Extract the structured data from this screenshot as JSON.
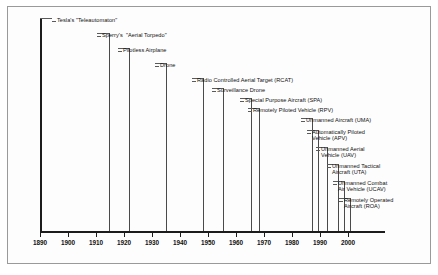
{
  "chart_data": {
    "type": "timeline",
    "title": "",
    "xlabel": "",
    "ylabel": "",
    "xlim": [
      1890,
      2005
    ],
    "grid": false,
    "legend": null,
    "axis_ticks": [
      1890,
      1900,
      1910,
      1920,
      1930,
      1940,
      1950,
      1960,
      1970,
      1980,
      1990,
      2000
    ],
    "tick_labels": [
      "1890",
      "1900",
      "1910",
      "1920",
      "1930",
      "1940",
      "1950",
      "1960",
      "1970",
      "1980",
      "1990",
      "2000"
    ],
    "events": [
      {
        "year": 1890,
        "label": "Tesla's \"Teleautomaton\"",
        "lines": [
          "Tesla's \"Teleautomaton\""
        ]
      },
      {
        "year": 1915,
        "label": "Sperry's  \"Aerial Torpedo\"",
        "lines": [
          "Sperry's  \"Aerial Torpedo\""
        ]
      },
      {
        "year": 1922,
        "label": "Pilotless Airplane",
        "lines": [
          "Pilotless Airplane"
        ]
      },
      {
        "year": 1935,
        "label": "Drone",
        "lines": [
          "Drone"
        ]
      },
      {
        "year": 1948,
        "label": "Radio Controlled Aerial Target (RCAT)",
        "lines": [
          "Radio Controlled Aerial Target (RCAT)"
        ]
      },
      {
        "year": 1955,
        "label": "Surveillance Drone",
        "lines": [
          "Surveillance Drone"
        ]
      },
      {
        "year": 1965,
        "label": "Special Purpose Aircraft (SPA)",
        "lines": [
          "Special Purpose Aircraft (SPA)"
        ]
      },
      {
        "year": 1968,
        "label": "Remotely Piloted Vehicle (RPV)",
        "lines": [
          "Remotely Piloted Vehicle (RPV)"
        ]
      },
      {
        "year": 1987,
        "label": "Unmanned Aircraft (UMA)",
        "lines": [
          "Unmanned Aircraft (UMA)"
        ]
      },
      {
        "year": 1989,
        "label": "Automatically Piloted Vehicle (APV)",
        "lines": [
          "Automatically Piloted",
          "Vehicle (APV)"
        ]
      },
      {
        "year": 1992,
        "label": "Unmanned Aerial Vehicle (UAV)",
        "lines": [
          "Unmanned Aerial",
          "Vehicle (UAV)"
        ]
      },
      {
        "year": 1996,
        "label": "Unmanned Tactical Aircraft (UTA)",
        "lines": [
          "Unmanned Tactical",
          "Aircraft (UTA)"
        ]
      },
      {
        "year": 1998,
        "label": "Unmanned Combat Air Vehicle (UCAV)",
        "lines": [
          "Unmanned Combat",
          "Air Vehicle (UCAV)"
        ]
      },
      {
        "year": 2000,
        "label": "Remotely Operated Aircraft (ROA)",
        "lines": [
          "Remotely Operated",
          "Aircraft (ROA)"
        ]
      }
    ],
    "colors": {
      "event_line": "#4a4a4a",
      "first_event_line": "#1c1c1c",
      "leader": "#5a5a5a",
      "axis": "#1c1c1c",
      "text": "#101010",
      "frame": "#9a9a9a",
      "background": "#ffffff"
    }
  },
  "geometry": {
    "axis": {
      "x0": 40,
      "x1": 385,
      "y": 231
    },
    "year0": 1890,
    "year_px_per_decade": 28.0,
    "event_x": [
      40,
      109,
      129,
      166,
      203,
      223,
      251,
      259,
      312,
      318,
      327,
      338,
      344,
      350
    ],
    "leader_elbow_x": [
      52,
      97,
      118,
      155,
      192,
      212,
      240,
      248,
      301,
      307,
      316,
      327,
      333,
      339
    ],
    "label_x": [
      57,
      102,
      123,
      160,
      197,
      217,
      245,
      253,
      306,
      312,
      321,
      332,
      338,
      344
    ],
    "label_y": [
      21,
      36,
      51,
      66,
      81,
      91,
      101,
      111,
      121,
      133,
      150,
      167,
      184,
      201
    ],
    "line_top": [
      18,
      33,
      48,
      63,
      78,
      88,
      98,
      108,
      118,
      130,
      147,
      164,
      181,
      198
    ]
  }
}
